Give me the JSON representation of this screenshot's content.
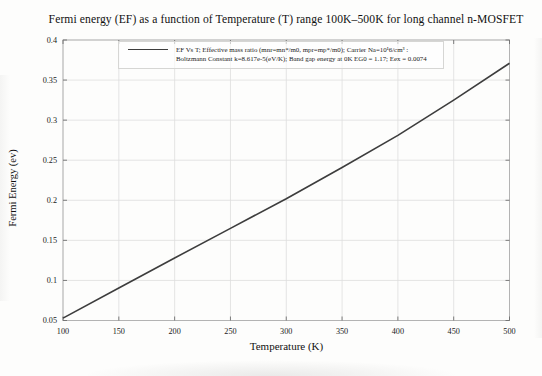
{
  "figure": {
    "background": "#fdfdfc"
  },
  "legend": {
    "entry_line1": "EF Vs T; Effective mass ratio (mnr=mn*/m0, mpr=mp*/m0); Carrier Na=10¹6/cm³ :",
    "entry_line2": "Boltzmann Constant k=8.617e-5(eV/K); Band gap energy at 0K EG0 = 1.17; Eex = 0.0074"
  },
  "chart_data": {
    "type": "line",
    "title": "Fermi energy (EF) as a function of Temperature (T) range 100K–500K for long channel n-MOSFET",
    "xlabel": "Temperature (K)",
    "ylabel": "Fermi Energy (ev)",
    "series": [
      {
        "name": "EF Vs T",
        "x": [
          100,
          150,
          200,
          250,
          300,
          350,
          400,
          450,
          500
        ],
        "y": [
          0.053,
          0.0905,
          0.128,
          0.165,
          0.202,
          0.241,
          0.281,
          0.325,
          0.371
        ]
      }
    ],
    "xlim": [
      100,
      500
    ],
    "ylim": [
      0.05,
      0.4
    ],
    "x_ticks": [
      "100",
      "150",
      "200",
      "250",
      "300",
      "350",
      "400",
      "450",
      "500"
    ],
    "y_ticks": [
      "0.05",
      "0.1",
      "0.15",
      "0.2",
      "0.25",
      "0.3",
      "0.35",
      "0.4"
    ],
    "grid": true,
    "legend_position": "top-center",
    "colors": {
      "line": "#3d3d3d",
      "grid": "#dddddd",
      "frame": "#b3b3b3",
      "tick": "#6f6f6f",
      "tick_text": "#1a1a1a"
    }
  }
}
